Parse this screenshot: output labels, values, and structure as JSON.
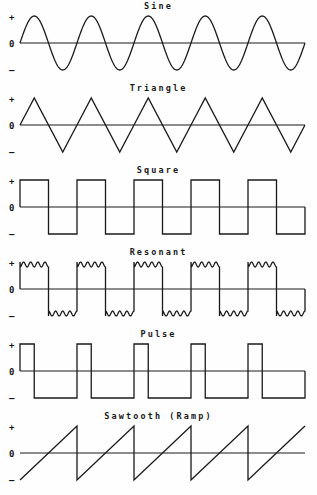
{
  "figure": {
    "background_color": "#fefefe",
    "line_color": "#1a1a1a",
    "text_color": "#141414",
    "width": 317,
    "height": 495
  },
  "axis_labels": {
    "positive": "+",
    "zero": "0",
    "negative": "–"
  },
  "panels": [
    {
      "id": "sine",
      "title": "Sine",
      "type": "sine",
      "cycles": 5,
      "duty": 0.5,
      "ripples": 0
    },
    {
      "id": "triangle",
      "title": "Triangle",
      "type": "triangle",
      "cycles": 5,
      "duty": 0.5,
      "ripples": 0
    },
    {
      "id": "square",
      "title": "Square",
      "type": "square",
      "cycles": 5,
      "duty": 0.5,
      "ripples": 0
    },
    {
      "id": "resonant",
      "title": "Resonant",
      "type": "resonant",
      "cycles": 5,
      "duty": 0.5,
      "ripples": 4
    },
    {
      "id": "pulse",
      "title": "Pulse",
      "type": "pulse",
      "cycles": 5,
      "duty": 0.25,
      "ripples": 0
    },
    {
      "id": "sawtooth",
      "title": "Sawtooth (Ramp)",
      "type": "sawtooth",
      "cycles": 5,
      "duty": 1.0,
      "ripples": 0
    }
  ],
  "chart_data": {
    "type": "line",
    "xlabel": "",
    "ylabel": "",
    "grid": false,
    "legend": "none",
    "ylim": [
      -1,
      1
    ],
    "ytick_labels": [
      "+",
      "0",
      "–"
    ],
    "ytick_values": [
      1,
      0,
      -1
    ],
    "plot_x_start": 20,
    "plot_x_end": 305,
    "series": [
      {
        "name": "Sine",
        "waveform": "sine",
        "cycles": 5,
        "amplitude": 1,
        "description": "Smooth sinusoid, 5 full cycles, starts at 0 rising."
      },
      {
        "name": "Triangle",
        "waveform": "triangle",
        "cycles": 5,
        "amplitude": 1,
        "description": "Linear ramps up and down, 5 full cycles, starts at 0 rising."
      },
      {
        "name": "Square",
        "waveform": "square",
        "cycles": 5,
        "amplitude": 1,
        "duty_cycle": 0.5,
        "description": "50 percent duty square wave, 5 full cycles, starts high."
      },
      {
        "name": "Resonant",
        "waveform": "resonant",
        "cycles": 5,
        "amplitude": 1,
        "duty_cycle": 0.5,
        "ripples_per_plateau": 4,
        "description": "Square wave with ringing oscillation riding on each plateau."
      },
      {
        "name": "Pulse",
        "waveform": "pulse",
        "cycles": 5,
        "amplitude": 1,
        "duty_cycle": 0.25,
        "description": "Narrow positive pulses, 25 percent duty cycle, 5 cycles."
      },
      {
        "name": "Sawtooth (Ramp)",
        "waveform": "sawtooth",
        "cycles": 5,
        "amplitude": 1,
        "description": "Rising linear ramp from minimum to maximum with sharp reset, 5 cycles."
      }
    ]
  }
}
